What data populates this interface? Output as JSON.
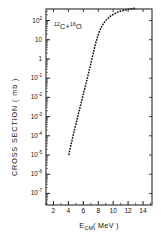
{
  "chart_data": {
    "type": "line",
    "title": "",
    "annotation": "12C + 16O",
    "annotation_parts": {
      "mass1": "12",
      "element1": "C",
      "plus": "+",
      "mass2": "16",
      "element2": "O"
    },
    "xlabel": "E_CM ( MeV )",
    "xlabel_parts": {
      "symbol": "E",
      "subscript": "CM",
      "units": "( MeV )"
    },
    "ylabel": "CROSS SECTION ( mb )",
    "xlim": [
      1.0,
      15.2
    ],
    "ylim": [
      -7.6,
      2.6
    ],
    "yscale": "log",
    "xscale": "linear",
    "grid": false,
    "legend": null,
    "xticks": [
      2,
      4,
      6,
      8,
      10,
      12,
      14
    ],
    "xtick_labels": [
      "2",
      "4",
      "6",
      "8",
      "10",
      "12",
      "14"
    ],
    "yticks": [
      2,
      1,
      0,
      -1,
      -2,
      -3,
      -4,
      -5,
      -6,
      -7
    ],
    "ytick_labels": [
      "10²",
      "10",
      "1",
      "10⁻¹",
      "10⁻²",
      "10⁻³",
      "10⁻⁴",
      "10⁻⁵",
      "10⁻⁶",
      "10⁻⁷"
    ],
    "ytick_mantissa": [
      "10",
      "10",
      "1",
      "10",
      "10",
      "10",
      "10",
      "10",
      "10",
      "10"
    ],
    "ytick_exponent": [
      "2",
      "",
      "",
      "-1",
      "-2",
      "-3",
      "-4",
      "-5",
      "-6",
      "-7"
    ],
    "series": [
      {
        "name": "fusion excitation function",
        "style": "dashed-line",
        "color": "#111111",
        "x": [
          4.05,
          4.2,
          4.4,
          4.6,
          4.8,
          5.0,
          5.2,
          5.4,
          5.6,
          5.8,
          6.0,
          6.2,
          6.4,
          6.6,
          6.8,
          7.0,
          7.25,
          7.5,
          7.75,
          8.0,
          8.3,
          8.6,
          9.0,
          9.4,
          9.8,
          10.3,
          10.8,
          11.4,
          12.0,
          12.6,
          13.1
        ],
        "y_log10": [
          -5.0,
          -4.72,
          -4.38,
          -4.05,
          -3.72,
          -3.4,
          -3.08,
          -2.76,
          -2.45,
          -2.14,
          -1.83,
          -1.52,
          -1.21,
          -0.9,
          -0.58,
          -0.25,
          0.17,
          0.58,
          0.96,
          1.26,
          1.56,
          1.78,
          2.0,
          2.15,
          2.27,
          2.38,
          2.46,
          2.53,
          2.58,
          2.62,
          2.64
        ]
      }
    ]
  },
  "axes": {
    "plot_left_px": 46,
    "plot_right_px": 152,
    "plot_top_px": 9,
    "plot_bottom_px": 205
  }
}
